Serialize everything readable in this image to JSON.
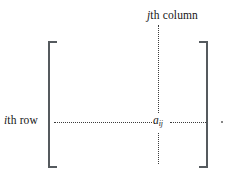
{
  "figure": {
    "type": "matrix-element-diagram",
    "background_color": "#ffffff",
    "ink_color": "#161616",
    "rule_color": "#555a5e",
    "dot_color": "#3b3b3b"
  },
  "labels": {
    "column": {
      "italic_part": "j",
      "roman_part": "th column",
      "full_text": "jth column"
    },
    "row": {
      "italic_part": "i",
      "roman_part": "th row",
      "full_text": "ith row"
    }
  },
  "element": {
    "base": "a",
    "subscript": "ij",
    "full_text": "aij"
  },
  "brackets": {
    "left": "[",
    "right": "]"
  },
  "guides": {
    "row_line": "horizontal dotted line",
    "column_line": "vertical dotted line",
    "trailing_dot": "."
  }
}
